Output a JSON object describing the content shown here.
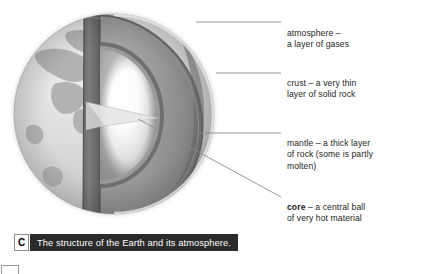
{
  "figure": {
    "caption_badge": "C",
    "caption_text": "The structure of the Earth and its atmosphere."
  },
  "labels": {
    "atmosphere": "atmosphere –\na layer of gases",
    "crust": "crust – a very thin\nlayer of solid rock",
    "mantle": "mantle – a thick layer\nof rock (some is partly\nmolten)",
    "core_term": "core",
    "core_rest": " – a central ball\nof very hot material"
  },
  "colors": {
    "label_text": "#231f20",
    "caption_bar_bg": "#2b2b2b",
    "caption_bar_text": "#ffffff",
    "leader_line": "#8a8a8a",
    "globe_surface_light": "#dcdcdc",
    "globe_surface_mid": "#c3c3c3",
    "land_mass": "#b0b0b0",
    "mantle_face": "#8d8d8d",
    "mantle_cut_dark": "#6f6f6f",
    "crust_edge": "#5c5c5c",
    "core_glow": "#ffffff",
    "halo": "#f0f0f0"
  },
  "diagram": {
    "type": "cross-section",
    "subject": "Earth",
    "layers": [
      "atmosphere",
      "crust",
      "mantle",
      "core"
    ]
  }
}
